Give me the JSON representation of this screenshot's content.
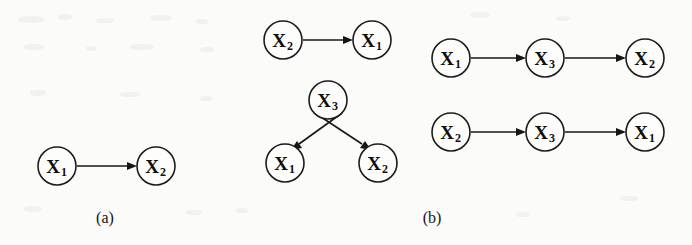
{
  "figure": {
    "background_color": "#fbfbfa",
    "ink_color": "#171513",
    "panels": [
      {
        "id": "a",
        "caption": "(a)",
        "caption_x": 105,
        "caption_y": 223,
        "graphs": [
          {
            "id": "a-graph-1",
            "nodes": [
              {
                "id": "a1n1",
                "base": "X",
                "sub": "1",
                "cx": 57,
                "cy": 166,
                "r": 19
              },
              {
                "id": "a1n2",
                "base": "X",
                "sub": "2",
                "cx": 156,
                "cy": 166,
                "r": 19
              }
            ],
            "edges": [
              {
                "id": "a1e1",
                "from": "a1n1",
                "to": "a1n2",
                "label": "X1 -> X2"
              }
            ]
          }
        ]
      },
      {
        "id": "b",
        "caption": "(b)",
        "caption_x": 432,
        "caption_y": 223,
        "graphs": [
          {
            "id": "b-graph-1",
            "nodes": [
              {
                "id": "b1n1",
                "base": "X",
                "sub": "2",
                "cx": 283,
                "cy": 40,
                "r": 19
              },
              {
                "id": "b1n2",
                "base": "X",
                "sub": "1",
                "cx": 372,
                "cy": 40,
                "r": 19
              }
            ],
            "edges": [
              {
                "id": "b1e1",
                "from": "b1n1",
                "to": "b1n2",
                "label": "X2 -> X1"
              }
            ]
          },
          {
            "id": "b-graph-2",
            "nodes": [
              {
                "id": "b2n3",
                "base": "X",
                "sub": "3",
                "cx": 328,
                "cy": 100,
                "r": 19
              },
              {
                "id": "b2n1",
                "base": "X",
                "sub": "1",
                "cx": 285,
                "cy": 163,
                "r": 19
              },
              {
                "id": "b2n2",
                "base": "X",
                "sub": "2",
                "cx": 378,
                "cy": 163,
                "r": 19
              }
            ],
            "edges": [
              {
                "id": "b2e1",
                "from": "b2n3",
                "to": "b2n1",
                "label": "X3 -> X1"
              },
              {
                "id": "b2e2",
                "from": "b2n3",
                "to": "b2n2",
                "label": "X3 -> X2"
              }
            ]
          },
          {
            "id": "b-graph-3",
            "nodes": [
              {
                "id": "b3n1",
                "base": "X",
                "sub": "1",
                "cx": 451,
                "cy": 58,
                "r": 19
              },
              {
                "id": "b3n2",
                "base": "X",
                "sub": "3",
                "cx": 545,
                "cy": 58,
                "r": 19
              },
              {
                "id": "b3n3",
                "base": "X",
                "sub": "2",
                "cx": 645,
                "cy": 58,
                "r": 19
              }
            ],
            "edges": [
              {
                "id": "b3e1",
                "from": "b3n1",
                "to": "b3n2",
                "label": "X1 -> X3"
              },
              {
                "id": "b3e2",
                "from": "b3n2",
                "to": "b3n3",
                "label": "X3 -> X2"
              }
            ]
          },
          {
            "id": "b-graph-4",
            "nodes": [
              {
                "id": "b4n1",
                "base": "X",
                "sub": "2",
                "cx": 451,
                "cy": 132,
                "r": 19
              },
              {
                "id": "b4n2",
                "base": "X",
                "sub": "3",
                "cx": 545,
                "cy": 132,
                "r": 19
              },
              {
                "id": "b4n3",
                "base": "X",
                "sub": "1",
                "cx": 645,
                "cy": 132,
                "r": 19
              }
            ],
            "edges": [
              {
                "id": "b4e1",
                "from": "b4n1",
                "to": "b4n2",
                "label": "X2 -> X3"
              },
              {
                "id": "b4e2",
                "from": "b4n2",
                "to": "b4n3",
                "label": "X3 -> X1"
              }
            ]
          }
        ]
      }
    ]
  }
}
